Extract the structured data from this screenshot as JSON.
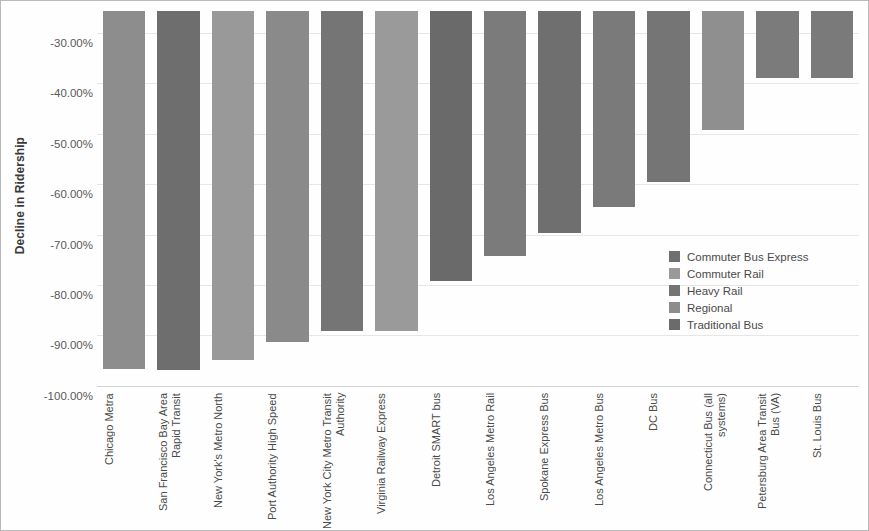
{
  "chart_data": {
    "type": "bar",
    "title": "",
    "xlabel": "",
    "ylabel": "Decline in Ridership",
    "ylim": [
      -100,
      -25
    ],
    "y_axis_inverted": true,
    "grid": true,
    "legend_position": "inside-right",
    "ytick_labels": [
      "-30.00%",
      "-40.00%",
      "-50.00%",
      "-60.00%",
      "-70.00%",
      "-80.00%",
      "-90.00%",
      "-100.00%"
    ],
    "ytick_values": [
      -30,
      -40,
      -50,
      -60,
      -70,
      -80,
      -90,
      -100
    ],
    "categories": [
      "Chicago Metra",
      "San Francisco Bay Area Rapid Transit",
      "New York's Metro North",
      "Port Authority High Speed",
      "New York City Metro Transit Authority",
      "Virginia Railway Express",
      "Detroit SMART bus",
      "Los Angeles Metro Rail",
      "Spokane Express Bus",
      "Los Angeles Metro Bus",
      "DC Bus",
      "Connecticut Bus (all systems)",
      "Petersburg Area Transit Bus (VA)",
      "St. Louis Bus"
    ],
    "values": [
      -96.6,
      -96.8,
      -94.9,
      -91.4,
      -89.1,
      -89.2,
      -79.2,
      -74.2,
      -69.6,
      -64.5,
      -59.6,
      -49.2,
      -39.0,
      -39.0
    ],
    "series_of": [
      "Commuter Rail",
      "Heavy Rail",
      "Commuter Rail",
      "Regional",
      "Heavy Rail",
      "Commuter Rail",
      "Traditional Bus",
      "Heavy Rail",
      "Commuter Bus Express",
      "Traditional Bus",
      "Traditional Bus",
      "Regional",
      "Traditional Bus",
      "Traditional Bus"
    ],
    "bar_colors": [
      "#8d8d8d",
      "#6e6e6e",
      "#999999",
      "#8a8a8a",
      "#757575",
      "#9a9a9a",
      "#6a6a6a",
      "#7b7b7b",
      "#6f6f6f",
      "#7a7a7a",
      "#757575",
      "#8f8f8f",
      "#7b7b7b",
      "#7a7a7a"
    ],
    "legend": [
      {
        "label": "Commuter Bus Express",
        "color": "#6f6f6f"
      },
      {
        "label": "Commuter Rail",
        "color": "#9a9a9a"
      },
      {
        "label": "Heavy Rail",
        "color": "#747474"
      },
      {
        "label": "Regional",
        "color": "#8d8d8d"
      },
      {
        "label": "Traditional Bus",
        "color": "#6b6b6b"
      }
    ],
    "colors": {
      "gridline": "#e6e6e6",
      "axis_text": "#595959",
      "label_text": "#4a4a4a",
      "frame_border": "#b9b9b9",
      "background": "#ffffff"
    }
  }
}
